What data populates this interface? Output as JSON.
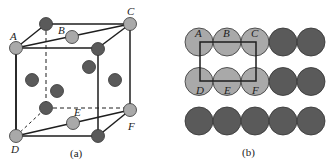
{
  "figure": {
    "panel_a": {
      "caption": "(a)",
      "labels": {
        "A": "A",
        "B": "B",
        "C": "C",
        "D": "D",
        "E": "E",
        "F": "F"
      }
    },
    "panel_b": {
      "caption": "(b)",
      "rows": 3,
      "cols": 5,
      "labels": {
        "A": "A",
        "B": "B",
        "C": "C",
        "D": "D",
        "E": "E",
        "F": "F"
      }
    },
    "colors": {
      "light_atom": "#a9a9a9",
      "dark_atom": "#5a5a5a",
      "line": "#1e1e1e"
    }
  }
}
